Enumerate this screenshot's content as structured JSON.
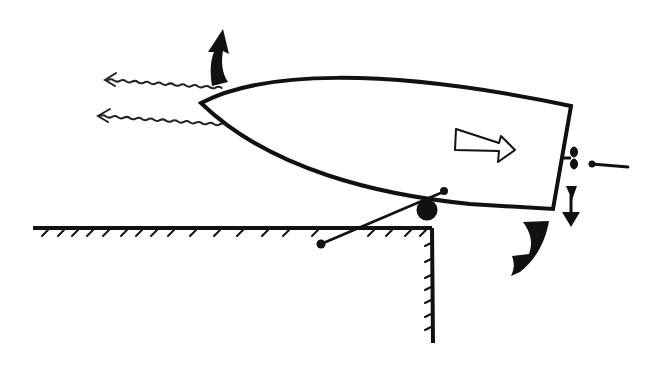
{
  "diagram": {
    "type": "line-drawing",
    "colors": {
      "background": "#ffffff",
      "ink": "#111111"
    },
    "elements": [
      {
        "name": "boat-hull",
        "description": "pointed bow on left, square stern on right"
      },
      {
        "name": "thrust-arrow",
        "description": "hollow arrow inside hull pointing right"
      },
      {
        "name": "wake-arrows",
        "count": 2,
        "description": "wavy arrows pointing left ahead of bow"
      },
      {
        "name": "bow-rotation-arrow",
        "direction": "up"
      },
      {
        "name": "stern-rotation-arrow",
        "direction": "down"
      },
      {
        "name": "stern-down-arrow",
        "direction": "down"
      },
      {
        "name": "propeller",
        "location": "stern"
      },
      {
        "name": "dock",
        "description": "hatched horizontal surface with vertical face"
      },
      {
        "name": "roller",
        "location": "dock corner"
      },
      {
        "name": "pivot-line",
        "description": "line with dot ends crossing roller"
      }
    ]
  }
}
